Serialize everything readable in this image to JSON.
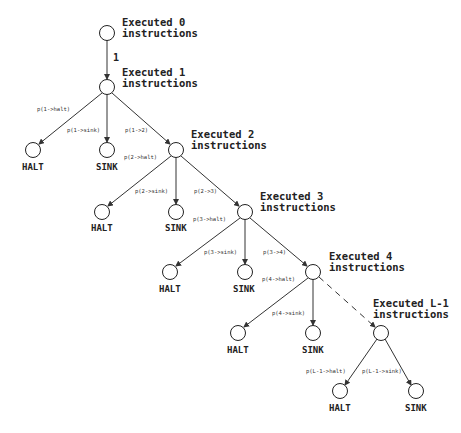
{
  "diagram": {
    "type": "probability-tree",
    "levels": [
      {
        "title_line1": "Executed 0",
        "title_line2": "instructions"
      },
      {
        "title_line1": "Executed 1",
        "title_line2": "instructions"
      },
      {
        "title_line1": "Executed 2",
        "title_line2": "instructions"
      },
      {
        "title_line1": "Executed 3",
        "title_line2": "instructions"
      },
      {
        "title_line1": "Executed 4",
        "title_line2": "instructions"
      },
      {
        "title_line1": "Executed L-1",
        "title_line2": "instructions"
      }
    ],
    "edge_0_1": "1",
    "terminals": {
      "halt": "HALT",
      "sink": "SINK"
    },
    "probabilities": {
      "l1": {
        "halt": "p(1->halt)",
        "sink": "p(1->sink)",
        "next": "p(1->2)"
      },
      "l2": {
        "halt": "p(2->halt)",
        "sink": "p(2->sink)",
        "next": "p(2->3)"
      },
      "l3": {
        "halt": "p(3->halt)",
        "sink": "p(3->sink)",
        "next": "p(3->4)"
      },
      "l4": {
        "halt": "p(4->halt)",
        "sink": "p(4->sink)"
      },
      "lL": {
        "halt": "p(L-1->halt)",
        "sink": "p(L-1->sink)"
      }
    }
  }
}
